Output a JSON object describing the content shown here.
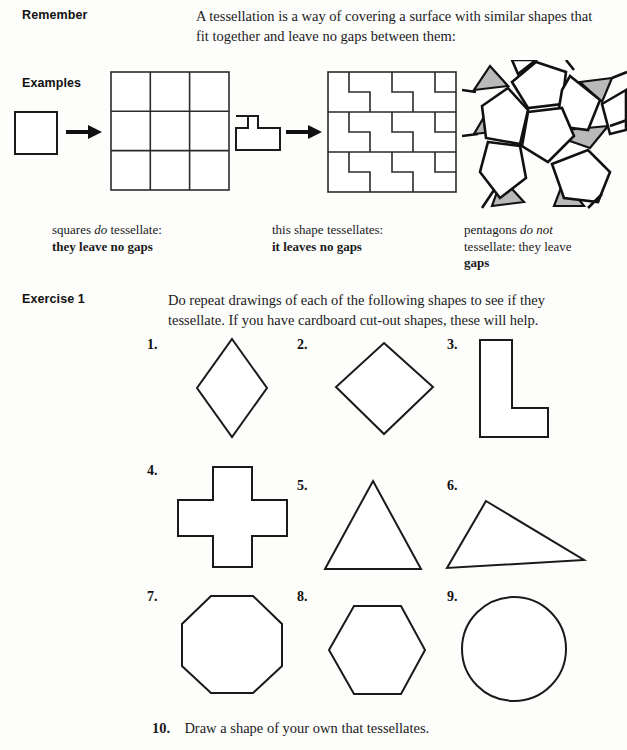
{
  "sections": {
    "remember": {
      "label": "Remember",
      "text_line1": "A tessellation is a way of covering a surface with similar shapes that",
      "text_line2": "fit together and leave no gaps between them:"
    },
    "examples": {
      "label": "Examples",
      "captions": [
        {
          "line1_pre": "squares ",
          "line1_em": "do",
          "line1_post": " tessellate:",
          "line2": "they leave no gaps"
        },
        {
          "line1_pre": "this shape tessellates:",
          "line1_em": "",
          "line1_post": "",
          "line2": "it leaves no gaps"
        },
        {
          "line1_pre": "pentagons ",
          "line1_em": "do not",
          "line1_post": "",
          "line2": "tessellate: they leave",
          "line3": "gaps"
        }
      ]
    },
    "exercise": {
      "label": "Exercise 1",
      "text_line1": "Do repeat drawings of each of the following shapes to see if they",
      "text_line2": "tessellate. If you have cardboard cut-out shapes, these will help.",
      "items": [
        {
          "number": "1.",
          "shape": "rhombus"
        },
        {
          "number": "2.",
          "shape": "square-rotated"
        },
        {
          "number": "3.",
          "shape": "l-shape"
        },
        {
          "number": "4.",
          "shape": "cross"
        },
        {
          "number": "5.",
          "shape": "equilateral-triangle"
        },
        {
          "number": "6.",
          "shape": "scalene-triangle"
        },
        {
          "number": "7.",
          "shape": "octagon"
        },
        {
          "number": "8.",
          "shape": "hexagon"
        },
        {
          "number": "9.",
          "shape": "circle"
        }
      ],
      "final_item": {
        "number": "10.",
        "text": "Draw a shape of your own that tessellates."
      }
    }
  },
  "colors": {
    "ink": "#1a1a1a",
    "paper": "#fdfdfb",
    "gap_shade": "#b9b9b9"
  }
}
